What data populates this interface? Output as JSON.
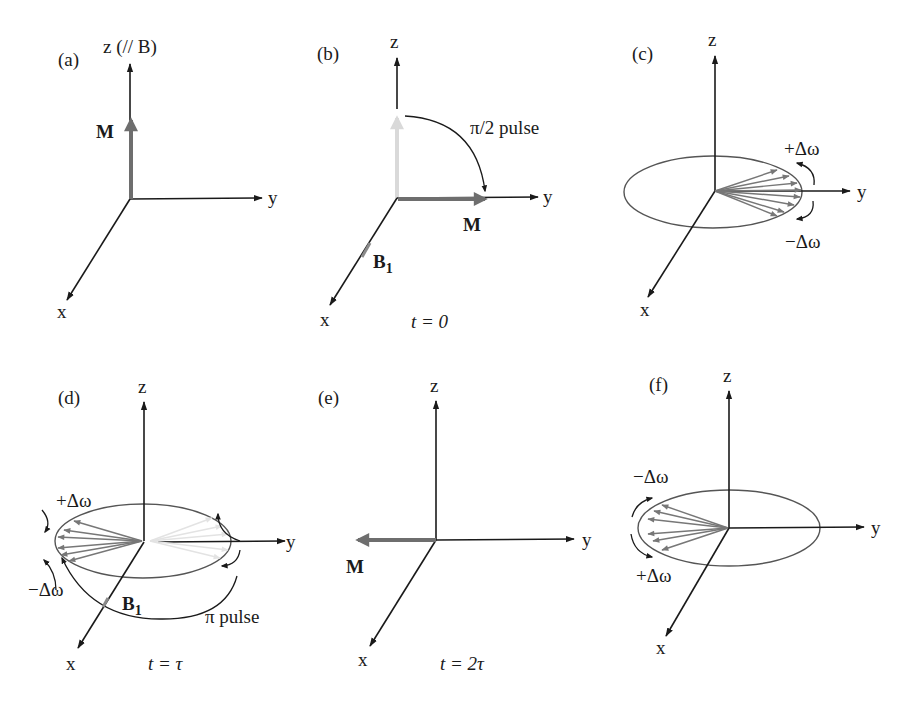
{
  "figure": {
    "colors": {
      "axes": "#1a1a1a",
      "magnetization": "#6e6e6e",
      "ghost": "#d9d9d9",
      "spins": "#777777"
    },
    "panels": [
      {
        "id": "a",
        "label": "(a)",
        "z_axis": "z (// B)",
        "y_axis": "y",
        "x_axis": "x",
        "vector_label": "M"
      },
      {
        "id": "b",
        "label": "(b)",
        "z_axis": "z",
        "y_axis": "y",
        "x_axis": "x",
        "vector_label": "M",
        "field_label": "B",
        "field_sub": "1",
        "pulse_label": "π/2 pulse",
        "time_label": "t = 0"
      },
      {
        "id": "c",
        "label": "(c)",
        "z_axis": "z",
        "y_axis": "y",
        "x_axis": "x",
        "plus_label": "+Δω",
        "minus_label": "−Δω"
      },
      {
        "id": "d",
        "label": "(d)",
        "z_axis": "z",
        "y_axis": "y",
        "x_axis": "x",
        "plus_label": "+Δω",
        "minus_label": "−Δω",
        "field_label": "B",
        "field_sub": "1",
        "pulse_label": "π pulse",
        "time_label": "t = τ"
      },
      {
        "id": "e",
        "label": "(e)",
        "z_axis": "z",
        "y_axis": "y",
        "x_axis": "x",
        "vector_label": "M",
        "time_label": "t = 2τ"
      },
      {
        "id": "f",
        "label": "(f)",
        "z_axis": "z",
        "y_axis": "y",
        "x_axis": "x",
        "minus_label": "−Δω",
        "plus_label": "+Δω"
      }
    ]
  }
}
